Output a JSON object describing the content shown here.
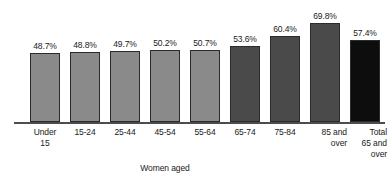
{
  "chart_data": {
    "type": "bar",
    "title": "",
    "subtitle": "",
    "xlabel": "Women aged",
    "ylabel": "",
    "ylim": [
      0,
      80
    ],
    "grid": false,
    "legend": "none",
    "categories": [
      "Under\n15",
      "15-24",
      "25-44",
      "45-54",
      "55-64",
      "65-74",
      "75-84",
      "85 and\nover",
      "Total\n65 and\nover"
    ],
    "values": [
      48.7,
      48.8,
      49.7,
      50.2,
      50.7,
      53.6,
      60.4,
      69.8,
      57.4
    ],
    "value_labels": [
      "48.7%",
      "48.8%",
      "49.7%",
      "50.2%",
      "50.7%",
      "53.6%",
      "60.4%",
      "69.8%",
      "57.4%"
    ],
    "bar_colors": [
      "#8a8a8a",
      "#8a8a8a",
      "#8a8a8a",
      "#8a8a8a",
      "#8a8a8a",
      "#4a4a4a",
      "#4a4a4a",
      "#4a4a4a",
      "#0d0d0d"
    ],
    "label_align": [
      "center",
      "center",
      "center",
      "center",
      "center",
      "center",
      "center",
      "right",
      "right"
    ],
    "bar_outline_color": "#2b2b2b",
    "axis_line_color": "#4d4d4d",
    "background_color": "#ffffff",
    "text_color": "#1a1a1a"
  }
}
